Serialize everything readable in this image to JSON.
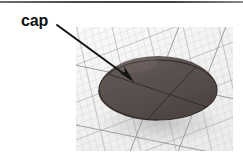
{
  "figure": {
    "type": "photograph-with-callout",
    "annotations": [
      {
        "label": "cap",
        "leader": {
          "from": [
            57,
            25
          ],
          "to": [
            133,
            81
          ],
          "style": "solid-line-with-arrowhead"
        }
      }
    ]
  },
  "labels": {
    "cap": "cap"
  },
  "colors": {
    "label_text": "#111111",
    "leader_line": "#141414",
    "dome_body": "#5a5250",
    "dome_body_dark": "#443c3a",
    "dome_cap_top": "#4b4341",
    "dome_highlight": "#766c69",
    "dome_rim_shadow": "#2e2826",
    "photo_background": "#f4f4f3",
    "grid_line": "#b9bcc0",
    "grid_line_major": "#8d9196",
    "top_rule": "#4a4a4a",
    "page_background": "#ffffff"
  },
  "geometry": {
    "canvas": {
      "width": 243,
      "height": 161
    },
    "top_rule": {
      "x": 0,
      "y": 1,
      "width": 243,
      "height": 2
    },
    "photo_panel": {
      "x": 76,
      "y": 27,
      "width": 157,
      "height": 124
    },
    "dome": {
      "base_ellipse_center": [
        82,
        63
      ],
      "base_ellipse_rx": 59,
      "base_ellipse_ry": 30,
      "apex_offset_y": -33,
      "cap_seam_arc": "curved line across upper dome separating the cap"
    },
    "base_face_chords": [
      {
        "from": [
          25,
          44
        ],
        "to": [
          140,
          82
        ]
      },
      {
        "from": [
          72,
          93
        ],
        "to": [
          122,
          40
        ]
      }
    ]
  },
  "icons": {
    "arrowhead": "arrowhead-icon"
  }
}
